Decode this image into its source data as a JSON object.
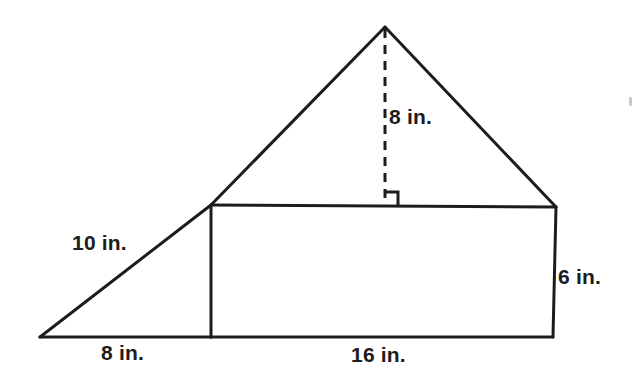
{
  "figure": {
    "kind": "composite-geometry-diagram",
    "background_color": "#ffffff",
    "stroke_color": "#1c1c1c",
    "units": "in.",
    "labels": {
      "altitude": "8 in.",
      "slant_side": "10 in.",
      "right_side": "6 in.",
      "base_left": "8 in.",
      "base_right": "16 in."
    },
    "shapes": {
      "apex": {
        "x": 385,
        "y": 27
      },
      "left_vertex": {
        "x": 40,
        "y": 337
      },
      "rect_top_left": {
        "x": 211,
        "y": 205
      },
      "rect_top_right": {
        "x": 556,
        "y": 207
      },
      "rect_bottom_right": {
        "x": 553,
        "y": 337
      },
      "rect_bottom_left": {
        "x": 211,
        "y": 337
      },
      "altitude_foot": {
        "x": 385,
        "y": 205
      }
    },
    "measures": {
      "triangle_height": 8,
      "triangle_base": 16,
      "rectangle_width": 16,
      "rectangle_height": 6,
      "left_triangle_base": 8,
      "left_triangle_hypotenuse": 10
    },
    "markers": {
      "right_angle": "square-right-angle-marker",
      "altitude_style": "dashed"
    }
  }
}
